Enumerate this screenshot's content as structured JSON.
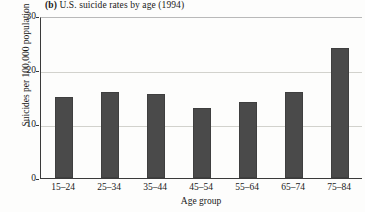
{
  "chart_data": {
    "type": "bar",
    "title": "(b) U.S. suicide rates by age (1994)",
    "title_panel_letter": "(b)",
    "title_rest": " U.S. suicide rates by age (1994)",
    "xlabel": "Age group",
    "ylabel": "Suicides per 100,000 population",
    "categories": [
      "15–24",
      "25–34",
      "35–44",
      "45–54",
      "55–64",
      "65–74",
      "75–84"
    ],
    "values": [
      15,
      16,
      15.5,
      13,
      14,
      16,
      24
    ],
    "ylim": [
      0,
      30
    ],
    "yticks": [
      0,
      10,
      20,
      30
    ],
    "ytick_labels": [
      "0",
      "10",
      "20",
      "30"
    ],
    "grid": "horizontal",
    "legend": "none",
    "bar_color": "#4a4a4a",
    "grid_color": "#d2d2cd",
    "axis_color": "#3a3a3a",
    "background": "#fdfdfc"
  }
}
